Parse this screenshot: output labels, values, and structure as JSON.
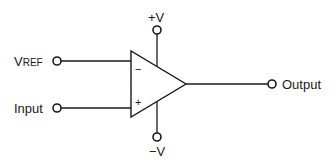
{
  "diagram": {
    "component": "operational-amplifier",
    "labels": {
      "vref_main": "V",
      "vref_sub": "REF",
      "input": "Input",
      "output": "Output",
      "pos_supply": "+V",
      "neg_supply": "−V",
      "inverting_sign": "−",
      "noninverting_sign": "+"
    },
    "connections": [
      {
        "from": "VREF",
        "to": "inverting-input"
      },
      {
        "from": "Input",
        "to": "non-inverting-input"
      },
      {
        "from": "op-amp-output",
        "to": "Output"
      },
      {
        "from": "+V",
        "to": "positive-supply"
      },
      {
        "from": "−V",
        "to": "negative-supply"
      }
    ],
    "colors": {
      "line": "#1a1a1a",
      "background": "#ffffff"
    }
  }
}
